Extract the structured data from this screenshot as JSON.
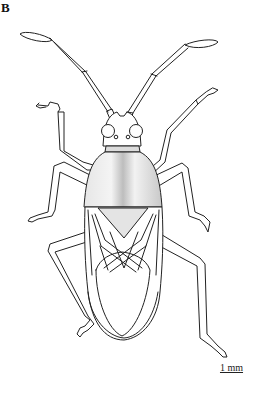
{
  "figure": {
    "panel_label": "B",
    "scale_bar": {
      "label": "1 mm"
    },
    "colors": {
      "line": "#222222",
      "shading": "#bdbdbd",
      "background": "#ffffff"
    }
  }
}
